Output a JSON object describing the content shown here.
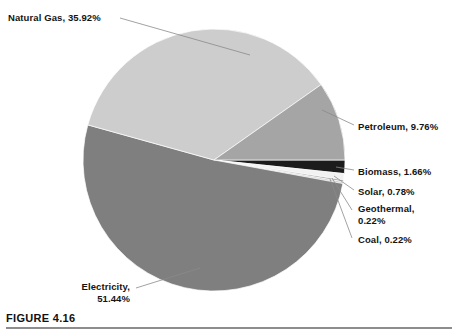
{
  "figure": {
    "caption_label": "FIGURE 4.16",
    "caption_subtext": ""
  },
  "chart_data": {
    "type": "pie",
    "title": "",
    "xlabel": "",
    "ylabel": "",
    "legend_position": "callout-labels",
    "grid": false,
    "units": "percent",
    "center": {
      "x": 214,
      "y": 160
    },
    "radius": 131,
    "start_angle_deg": 0,
    "direction": "clockwise",
    "categories": [
      "Biomass",
      "Solar",
      "Geothermal",
      "Coal",
      "Electricity",
      "Natural Gas",
      "Petroleum"
    ],
    "values": [
      1.66,
      0.78,
      0.22,
      0.22,
      51.44,
      35.92,
      9.76
    ],
    "slices": [
      {
        "name": "Biomass",
        "value": 1.66,
        "label": "Biomass, 1.66%",
        "color": "#1c1c1c"
      },
      {
        "name": "Solar",
        "value": 0.78,
        "label": "Solar, 0.78%",
        "color": "#f2f2f2"
      },
      {
        "name": "Geothermal",
        "value": 0.22,
        "label": "Geothermal, 0.22%",
        "color": "#9b9b9b"
      },
      {
        "name": "Coal",
        "value": 0.22,
        "label": "Coal, 0.22%",
        "color": "#c9c9c9"
      },
      {
        "name": "Electricity",
        "value": 51.44,
        "label": "Electricity, 51.44%",
        "color": "#7f7f7f"
      },
      {
        "name": "Natural Gas",
        "value": 35.92,
        "label": "Natural Gas, 35.92%",
        "color": "#cdcdcd"
      },
      {
        "name": "Petroleum",
        "value": 9.76,
        "label": "Petroleum, 9.76%",
        "color": "#a5a5a5"
      }
    ]
  },
  "labels": {
    "natural_gas": "Natural Gas, 35.92%",
    "petroleum": "Petroleum, 9.76%",
    "biomass": "Biomass, 1.66%",
    "solar": "Solar, 0.78%",
    "geothermal": "Geothermal,",
    "geothermal_value": "0.22%",
    "coal": "Coal, 0.22%",
    "electricity": "Electricity,",
    "electricity_value": "51.44%"
  }
}
